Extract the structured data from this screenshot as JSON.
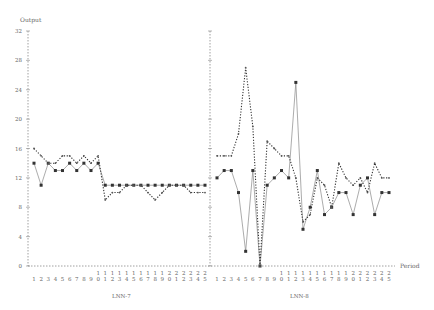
{
  "chart_data": {
    "type": "line",
    "ylabel": "Output",
    "xlabel": "Period",
    "ylim": [
      0,
      32
    ],
    "yticks": [
      0,
      4,
      8,
      12,
      16,
      20,
      24,
      28,
      32
    ],
    "grid": false,
    "panels": [
      {
        "label": "LNN-7",
        "x": [
          1,
          2,
          3,
          4,
          5,
          6,
          7,
          8,
          9,
          10,
          11,
          12,
          13,
          14,
          15,
          16,
          17,
          18,
          19,
          20,
          21,
          22,
          23,
          24,
          25
        ],
        "series": [
          {
            "name": "solid",
            "style": "solid",
            "values": [
              14,
              11,
              14,
              13,
              13,
              14,
              13,
              14,
              13,
              14,
              11,
              11,
              11,
              11,
              11,
              11,
              11,
              11,
              11,
              11,
              11,
              11,
              11,
              11,
              11
            ]
          },
          {
            "name": "dotted",
            "style": "dotted",
            "values": [
              16,
              15,
              14,
              14,
              15,
              15,
              14,
              15,
              14,
              15,
              9,
              10,
              10,
              11,
              11,
              11,
              10,
              9,
              10,
              11,
              11,
              11,
              10,
              10,
              10
            ]
          }
        ]
      },
      {
        "label": "LNN-8",
        "x": [
          1,
          2,
          3,
          4,
          5,
          6,
          7,
          8,
          9,
          10,
          11,
          12,
          13,
          14,
          15,
          16,
          17,
          18,
          19,
          20,
          21,
          22,
          23,
          24,
          25
        ],
        "series": [
          {
            "name": "solid",
            "style": "solid",
            "values": [
              12,
              13,
              13,
              10,
              2,
              13,
              0,
              11,
              12,
              13,
              12,
              25,
              5,
              8,
              13,
              7,
              8,
              10,
              10,
              7,
              11,
              12,
              7,
              10,
              10
            ]
          },
          {
            "name": "dotted",
            "style": "dotted",
            "values": [
              15,
              15,
              15,
              18,
              27,
              19,
              0,
              17,
              16,
              15,
              15,
              12,
              6,
              7,
              12,
              11,
              8,
              14,
              12,
              11,
              12,
              10,
              14,
              12,
              12
            ]
          }
        ]
      }
    ]
  },
  "labels": {
    "y_axis_title": "Output",
    "x_axis_title": "Period",
    "panel_left": "LNN-7",
    "panel_right": "LNN-8"
  }
}
